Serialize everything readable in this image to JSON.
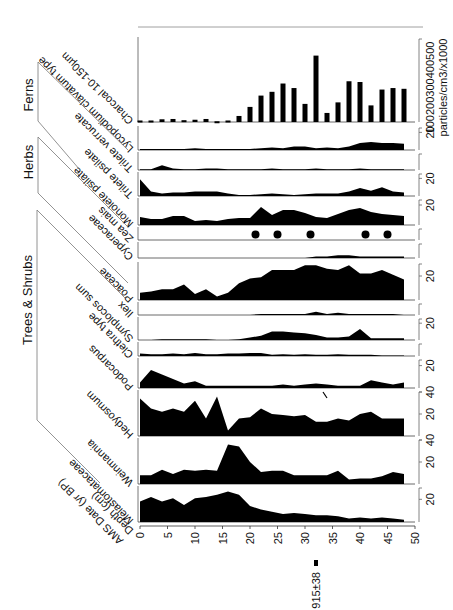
{
  "chart_data": {
    "type": "area",
    "title": "",
    "orientation": "rotated 90° clockwise (depth runs left-to-right along bottom)",
    "xlabel": "Depth (cm)",
    "xlabel2": "AMS Date (yr BP)",
    "x_ticks": [
      0,
      5,
      10,
      15,
      20,
      25,
      30,
      35,
      40,
      45,
      50
    ],
    "xlim": [
      0,
      50
    ],
    "depths": [
      0,
      2,
      4,
      6,
      8,
      10,
      12,
      14,
      16,
      18,
      20,
      22,
      24,
      26,
      28,
      30,
      32,
      34,
      36,
      38,
      40,
      42,
      44,
      46,
      48
    ],
    "ams_date": {
      "label": "915±38",
      "depth": 32
    },
    "groups": [
      {
        "name": "Trees & Shrubs",
        "taxa": [
          "Melastomataceae",
          "Weinmannia",
          "Hedyosmum",
          "Podocarpus",
          "Clethra type",
          "Symplocos sum",
          "Ilex"
        ]
      },
      {
        "name": "Herbs",
        "taxa": [
          "Poaceae",
          "Cyperaceae",
          "Zea mais",
          "Monolete psilate"
        ]
      },
      {
        "name": "Ferns",
        "taxa": [
          "Trilete psilate",
          "Trilete verrucate",
          "Lycopodium clavatum type"
        ]
      }
    ],
    "series": [
      {
        "name": "Melastomataceae",
        "unit": "%",
        "scale_max": 30,
        "scale_ticks": [
          20
        ],
        "values": [
          18,
          22,
          18,
          21,
          15,
          21,
          22,
          24,
          27,
          24,
          14,
          11,
          9,
          7,
          8,
          7,
          6,
          6,
          5,
          3,
          4,
          3,
          4,
          3,
          2
        ]
      },
      {
        "name": "Weinmannia",
        "unit": "%",
        "scale_max": 40,
        "scale_ticks": [
          20,
          40
        ],
        "values": [
          8,
          8,
          13,
          9,
          13,
          12,
          13,
          12,
          36,
          34,
          20,
          11,
          12,
          12,
          8,
          8,
          8,
          8,
          12,
          4,
          5,
          5,
          7,
          11,
          9
        ]
      },
      {
        "name": "Hedyosmum",
        "unit": "%",
        "scale_max": 40,
        "scale_ticks": [
          20,
          40
        ],
        "values": [
          34,
          25,
          22,
          25,
          22,
          32,
          16,
          36,
          5,
          16,
          17,
          25,
          20,
          19,
          18,
          19,
          13,
          13,
          16,
          14,
          20,
          22,
          16,
          16,
          16
        ]
      },
      {
        "name": "Podocarpus",
        "unit": "%",
        "scale_max": 25,
        "scale_ticks": [
          20
        ],
        "values": [
          5,
          16,
          12,
          8,
          4,
          6,
          2,
          2,
          2,
          2,
          2,
          2,
          2,
          3,
          2,
          3,
          4,
          3,
          2,
          2,
          2,
          7,
          5,
          3,
          5
        ]
      },
      {
        "name": "Clethra type",
        "unit": "%",
        "scale_max": 20,
        "scale_ticks": [],
        "values": [
          4,
          3,
          3,
          4,
          3,
          5,
          3,
          3,
          4,
          4,
          5,
          5,
          2,
          3,
          2,
          3,
          2,
          2,
          3,
          2,
          2,
          2,
          1,
          1,
          1
        ]
      },
      {
        "name": "Symplocos sum",
        "unit": "%",
        "scale_max": 25,
        "scale_ticks": [
          20
        ],
        "values": [
          0,
          0,
          1,
          1,
          1,
          1,
          1,
          0,
          0,
          1,
          3,
          5,
          10,
          10,
          9,
          8,
          6,
          3,
          3,
          4,
          13,
          2,
          2,
          2,
          2
        ]
      },
      {
        "name": "Ilex",
        "unit": "%",
        "scale_max": 10,
        "scale_ticks": [],
        "values": [
          0,
          0,
          0,
          0,
          0,
          0,
          0,
          0,
          0,
          0,
          0,
          1,
          1,
          1,
          1,
          1,
          3,
          1,
          2,
          1,
          1,
          1,
          1,
          1,
          0
        ]
      },
      {
        "name": "Poaceae",
        "unit": "%",
        "scale_max": 30,
        "scale_ticks": [
          20
        ],
        "values": [
          6,
          7,
          9,
          9,
          13,
          5,
          9,
          3,
          6,
          14,
          18,
          19,
          25,
          25,
          25,
          29,
          29,
          26,
          25,
          29,
          22,
          22,
          25,
          21,
          17
        ]
      },
      {
        "name": "Cyperaceae",
        "unit": "%",
        "scale_max": 10,
        "scale_ticks": [],
        "values": [
          0,
          0,
          0,
          0,
          0,
          0,
          0,
          0,
          0,
          0,
          0,
          0,
          0,
          0,
          0,
          0,
          1,
          1,
          2,
          2,
          1,
          1,
          1,
          1,
          1
        ]
      },
      {
        "name": "Zea mais",
        "unit": "presence",
        "present_at_depths": [
          21,
          25,
          31,
          41,
          45
        ]
      },
      {
        "name": "Monolete psilate",
        "unit": "%",
        "scale_max": 25,
        "scale_ticks": [
          20
        ],
        "values": [
          8,
          6,
          6,
          9,
          9,
          4,
          5,
          4,
          6,
          7,
          7,
          18,
          10,
          15,
          15,
          12,
          8,
          7,
          11,
          15,
          17,
          13,
          11,
          10,
          9
        ]
      },
      {
        "name": "Trilete psilate",
        "unit": "%",
        "scale_max": 25,
        "scale_ticks": [
          20
        ],
        "values": [
          19,
          5,
          3,
          4,
          4,
          5,
          5,
          5,
          3,
          1,
          1,
          2,
          3,
          2,
          1,
          2,
          3,
          3,
          3,
          5,
          9,
          6,
          10,
          5,
          4
        ]
      },
      {
        "name": "Trilete verrucate",
        "unit": "%",
        "scale_max": 20,
        "scale_ticks": [],
        "values": [
          1,
          1,
          6,
          2,
          1,
          1,
          2,
          2,
          1,
          1,
          1,
          1,
          2,
          1,
          1,
          1,
          2,
          1,
          1,
          1,
          2,
          1,
          1,
          1,
          1
        ]
      },
      {
        "name": "Lycopodium clavatum type",
        "unit": "%",
        "scale_max": 25,
        "scale_ticks": [
          20
        ],
        "values": [
          1,
          1,
          1,
          1,
          1,
          2,
          1,
          1,
          1,
          1,
          1,
          2,
          3,
          2,
          4,
          4,
          2,
          3,
          2,
          4,
          8,
          9,
          8,
          8,
          7
        ]
      },
      {
        "name": "Charcoal 10-150µm",
        "unit": "particles/cm3/x1000",
        "type": "bar",
        "scale_max": 550,
        "scale_ticks": [
          100,
          200,
          300,
          400,
          500
        ],
        "values": [
          10,
          10,
          18,
          20,
          12,
          15,
          20,
          5,
          10,
          40,
          100,
          175,
          200,
          255,
          225,
          120,
          440,
          60,
          130,
          270,
          265,
          110,
          215,
          225,
          220
        ]
      }
    ]
  },
  "labels": {
    "group_trees": "Trees & Shrubs",
    "group_herbs": "Herbs",
    "group_ferns": "Ferns",
    "depth_label": "Depth (cm)",
    "date_label": "AMS Date (yr BP)",
    "date_value": "915±38",
    "charcoal_unit": "particles/cm3/x1000",
    "charcoal_ticks": "100200300400500"
  }
}
